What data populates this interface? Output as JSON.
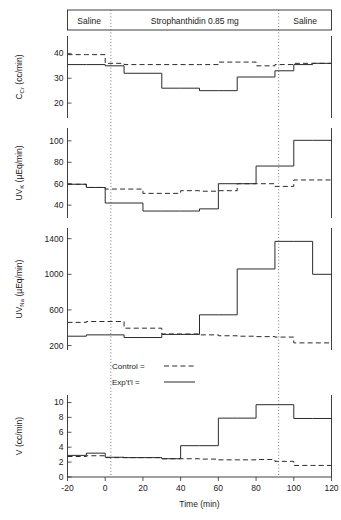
{
  "figure": {
    "title": "",
    "xlabel": "Time  (min)"
  },
  "banner": {
    "segments": [
      {
        "label": "Saline",
        "x_start": -20,
        "x_end": 3
      },
      {
        "label": "Strophanthidin  0.85 mg",
        "x_start": 3,
        "x_end": 92
      },
      {
        "label": "Saline",
        "x_start": 92,
        "x_end": 120
      }
    ]
  },
  "legend": {
    "position": "inside-middle-left",
    "entries": [
      {
        "label": "Control  =",
        "style": "dashed"
      },
      {
        "label": "Exp't'l  =",
        "style": "solid"
      }
    ]
  },
  "event_markers": [
    3,
    92
  ],
  "chart_data": [
    {
      "type": "line",
      "panel": "C_Cr",
      "title": "",
      "ylabel": "C",
      "ylabel_sub": "Cr",
      "ylabel_units": "(cc/min)",
      "xlabel": "",
      "xlim": [
        -20,
        120
      ],
      "ylim": [
        14,
        47
      ],
      "yticks": [
        20,
        30,
        40
      ],
      "xticks": [
        -20,
        0,
        20,
        40,
        60,
        80,
        100,
        120
      ],
      "grid": false,
      "step": "post",
      "bin_edges": [
        -20,
        -10,
        0,
        10,
        20,
        30,
        40,
        50,
        60,
        70,
        80,
        90,
        100,
        110,
        120
      ],
      "series": [
        {
          "name": "Control",
          "style": "dashed",
          "values": [
            39.5,
            39.5,
            36.0,
            35.5,
            35.5,
            35.5,
            35.5,
            35.5,
            36.5,
            36.5,
            35.0,
            35.5,
            36.0,
            36.0
          ]
        },
        {
          "name": "Exp't'l",
          "style": "solid",
          "values": [
            35.5,
            35.5,
            35.0,
            32.0,
            32.0,
            26.0,
            26.0,
            25.0,
            25.0,
            30.5,
            30.5,
            33.0,
            35.5,
            36.0
          ]
        }
      ]
    },
    {
      "type": "line",
      "panel": "UV_K",
      "title": "",
      "ylabel": "UV",
      "ylabel_sub": "K",
      "ylabel_units": "(µEq/min)",
      "xlabel": "",
      "xlim": [
        -20,
        120
      ],
      "ylim": [
        28,
        112
      ],
      "yticks": [
        40,
        60,
        80,
        100
      ],
      "xticks": [
        -20,
        0,
        20,
        40,
        60,
        80,
        100,
        120
      ],
      "grid": false,
      "step": "post",
      "bin_edges": [
        -20,
        -10,
        0,
        10,
        20,
        30,
        40,
        50,
        60,
        70,
        80,
        90,
        100,
        110,
        120
      ],
      "series": [
        {
          "name": "Control",
          "style": "dashed",
          "values": [
            59.5,
            56.5,
            55.0,
            55.0,
            51.0,
            51.0,
            53.5,
            53.0,
            53.5,
            60.0,
            60.0,
            57.5,
            63.5,
            63.5
          ]
        },
        {
          "name": "Exp't'l",
          "style": "solid",
          "values": [
            59.5,
            56.5,
            42.0,
            42.0,
            34.5,
            34.5,
            34.5,
            36.5,
            60.0,
            60.0,
            76.5,
            76.5,
            100.5,
            100.5
          ]
        }
      ]
    },
    {
      "type": "line",
      "panel": "UV_Na",
      "title": "",
      "ylabel": "UV",
      "ylabel_sub": "Na",
      "ylabel_units": "(µEq/min)",
      "xlabel": "",
      "xlim": [
        -20,
        120
      ],
      "ylim": [
        150,
        1520
      ],
      "yticks": [
        200,
        600,
        1000,
        1400
      ],
      "xticks": [
        -20,
        0,
        20,
        40,
        60,
        80,
        100,
        120
      ],
      "grid": false,
      "step": "post",
      "bin_edges": [
        -20,
        -10,
        0,
        10,
        20,
        30,
        40,
        50,
        60,
        70,
        80,
        90,
        100,
        110,
        120
      ],
      "series": [
        {
          "name": "Control",
          "style": "dashed",
          "values": [
            460,
            470,
            470,
            395,
            395,
            330,
            330,
            320,
            310,
            305,
            300,
            295,
            230,
            230
          ]
        },
        {
          "name": "Exp't'l",
          "style": "solid",
          "values": [
            305,
            320,
            320,
            290,
            290,
            325,
            325,
            545,
            545,
            1060,
            1060,
            1370,
            1370,
            1000
          ]
        }
      ]
    },
    {
      "type": "line",
      "panel": "V",
      "title": "",
      "ylabel": "V",
      "ylabel_sub": "",
      "ylabel_units": "(cc/min)",
      "xlabel": "Time  (min)",
      "xlim": [
        -20,
        120
      ],
      "ylim": [
        0,
        11
      ],
      "yticks": [
        0,
        2,
        4,
        6,
        8,
        10
      ],
      "xticks": [
        -20,
        0,
        20,
        40,
        60,
        80,
        100,
        120
      ],
      "grid": false,
      "step": "post",
      "bin_edges": [
        -20,
        -10,
        0,
        10,
        20,
        30,
        40,
        50,
        60,
        70,
        80,
        90,
        100,
        110,
        120
      ],
      "series": [
        {
          "name": "Control",
          "style": "dashed",
          "values": [
            2.75,
            2.85,
            2.6,
            2.6,
            2.6,
            2.45,
            2.45,
            2.4,
            2.3,
            2.3,
            2.35,
            2.1,
            1.55,
            1.55
          ]
        },
        {
          "name": "Exp't'l",
          "style": "solid",
          "values": [
            2.9,
            3.2,
            2.65,
            2.6,
            2.6,
            2.45,
            4.2,
            4.2,
            7.9,
            7.9,
            9.7,
            9.7,
            7.85,
            7.85
          ]
        }
      ]
    }
  ]
}
